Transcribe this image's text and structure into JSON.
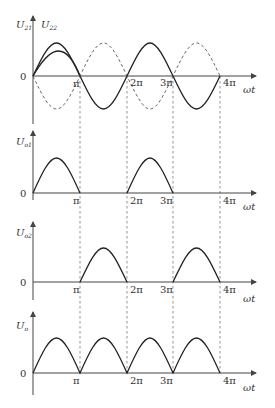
{
  "figure": {
    "x_marks": [
      "π",
      "2π",
      "3π",
      "4π"
    ],
    "x_axis_label": "ωt",
    "origin_label": "0",
    "panels": [
      {
        "id": "input",
        "y_labels": [
          {
            "main": "U",
            "sub": "21"
          },
          {
            "main": "U",
            "sub": "22"
          }
        ],
        "description": "U21 solid sine, U22 dashed inverted sine"
      },
      {
        "id": "output1",
        "y_labels": [
          {
            "main": "U",
            "sub": "o1"
          }
        ],
        "description": "positive half-cycles at 0–π and 2π–3π"
      },
      {
        "id": "output2",
        "y_labels": [
          {
            "main": "U",
            "sub": "o2"
          }
        ],
        "description": "positive half-cycles at π–2π and 3π–4π"
      },
      {
        "id": "output",
        "y_labels": [
          {
            "main": "U",
            "sub": "o"
          }
        ],
        "description": "full-wave rectified output"
      }
    ]
  },
  "colors": {
    "line": "#222222",
    "axis": "#444444",
    "dash": "#555555"
  }
}
